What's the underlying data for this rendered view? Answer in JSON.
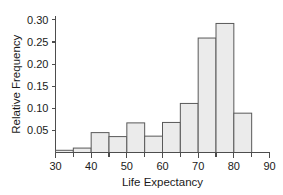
{
  "chart_data": {
    "type": "bar",
    "title": "",
    "subtitle": "",
    "xlabel": "Life Expectancy",
    "ylabel": "Relative Frequency",
    "xlim": [
      30,
      90
    ],
    "ylim": [
      0,
      0.31
    ],
    "grid": false,
    "legend": null,
    "bin_width": 5,
    "bin_edges": [
      30,
      35,
      40,
      45,
      50,
      55,
      60,
      65,
      70,
      75,
      80,
      85
    ],
    "categories": [
      "30-35",
      "35-40",
      "40-45",
      "45-50",
      "50-55",
      "55-60",
      "60-65",
      "65-70",
      "70-75",
      "75-80",
      "80-85"
    ],
    "values": [
      0.005,
      0.01,
      0.045,
      0.036,
      0.067,
      0.037,
      0.068,
      0.111,
      0.259,
      0.292,
      0.089
    ],
    "x_ticks_major": [
      30,
      40,
      50,
      60,
      70,
      80,
      90
    ],
    "x_tick_labels": [
      "30",
      "40",
      "50",
      "60",
      "70",
      "80",
      "90"
    ],
    "x_ticks_minor": [
      35,
      45,
      55,
      65,
      75,
      85
    ],
    "y_ticks": [
      0.05,
      0.1,
      0.15,
      0.2,
      0.25,
      0.3
    ],
    "y_tick_labels": [
      "0.05",
      "0.10",
      "0.15",
      "0.20",
      "0.25",
      "0.30"
    ],
    "colors": {
      "bar_fill": "#ebebeb",
      "bar_stroke": "#595959",
      "axis": "#4d4d4d",
      "text": "#1a1a1a",
      "background": "#ffffff"
    }
  }
}
